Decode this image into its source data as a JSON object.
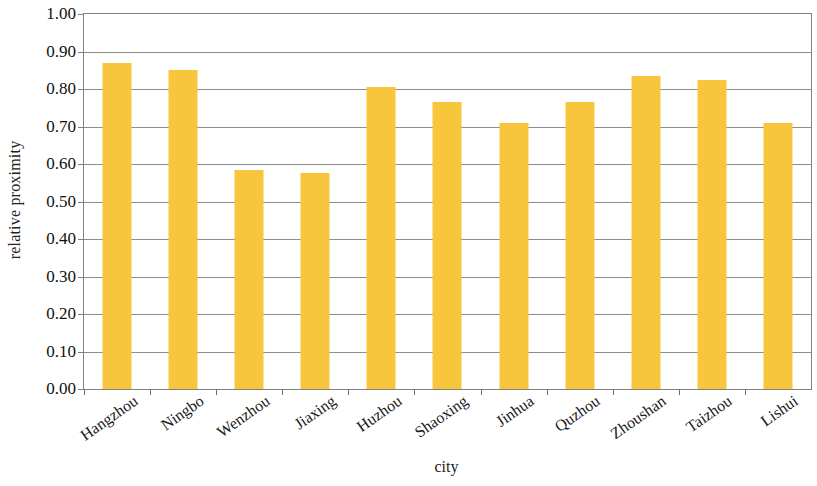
{
  "chart_data": {
    "type": "bar",
    "title": "",
    "xlabel": "city",
    "ylabel": "relative proximity",
    "categories": [
      "Hangzhou",
      "Ningbo",
      "Wenzhou",
      "Jiaxing",
      "Huzhou",
      "Shaoxing",
      "Jinhua",
      "Quzhou",
      "Zhoushan",
      "Taizhou",
      "Lishui"
    ],
    "values": [
      0.87,
      0.85,
      0.585,
      0.575,
      0.805,
      0.765,
      0.71,
      0.765,
      0.835,
      0.825,
      0.71
    ],
    "ylim": [
      0.0,
      1.0
    ],
    "ytick_step": 0.1,
    "ytick_labels": [
      "0.00",
      "0.10",
      "0.20",
      "0.30",
      "0.40",
      "0.50",
      "0.60",
      "0.70",
      "0.80",
      "0.90",
      "1.00"
    ],
    "ytick_values": [
      0.0,
      0.1,
      0.2,
      0.3,
      0.4,
      0.5,
      0.6,
      0.7,
      0.8,
      0.9,
      1.0
    ],
    "grid": true,
    "grid_axis": "y",
    "legend": false,
    "legend_position": "none",
    "bar_color": "#f8c63c",
    "grid_color": "#8c8c8c",
    "axis_color": "#808080",
    "background_color": "#ffffff",
    "series": [
      {
        "name": "relative proximity",
        "values": [
          0.87,
          0.85,
          0.585,
          0.575,
          0.805,
          0.765,
          0.71,
          0.765,
          0.835,
          0.825,
          0.71
        ]
      }
    ]
  }
}
